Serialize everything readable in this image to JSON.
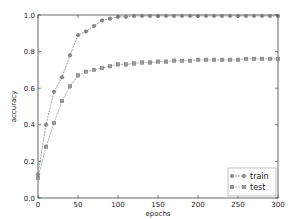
{
  "chart_data": {
    "type": "line",
    "title": "",
    "xlabel": "epochs",
    "ylabel": "accuracy",
    "xlim": [
      0,
      300
    ],
    "ylim": [
      0.0,
      1.0
    ],
    "xticks": [
      0,
      50,
      100,
      150,
      200,
      250,
      300
    ],
    "xtick_labels": [
      "0",
      "50",
      "100",
      "150",
      "200",
      "250",
      "300"
    ],
    "yticks": [
      0.0,
      0.2,
      0.4,
      0.6,
      0.8,
      1.0
    ],
    "ytick_labels": [
      "0.0",
      "0.2",
      "0.4",
      "0.6",
      "0.8",
      "1.0"
    ],
    "grid": false,
    "legend_position": "bottom-right",
    "x": [
      0,
      10,
      20,
      30,
      40,
      50,
      60,
      70,
      80,
      90,
      100,
      110,
      120,
      130,
      140,
      150,
      160,
      170,
      180,
      190,
      200,
      210,
      220,
      230,
      240,
      250,
      260,
      270,
      280,
      290,
      300
    ],
    "series": [
      {
        "name": "train",
        "marker": "circle",
        "color": "#888888",
        "values": [
          0.13,
          0.4,
          0.58,
          0.66,
          0.78,
          0.89,
          0.91,
          0.94,
          0.97,
          0.98,
          0.99,
          0.99,
          0.995,
          0.995,
          0.995,
          0.995,
          0.995,
          0.995,
          0.995,
          0.995,
          0.995,
          0.995,
          0.995,
          0.995,
          0.995,
          0.995,
          0.995,
          0.995,
          0.995,
          0.995,
          0.995
        ]
      },
      {
        "name": "test",
        "marker": "square",
        "color": "#999999",
        "values": [
          0.11,
          0.28,
          0.41,
          0.53,
          0.61,
          0.67,
          0.69,
          0.7,
          0.71,
          0.72,
          0.73,
          0.73,
          0.735,
          0.74,
          0.74,
          0.745,
          0.745,
          0.75,
          0.75,
          0.75,
          0.755,
          0.755,
          0.755,
          0.755,
          0.755,
          0.755,
          0.76,
          0.76,
          0.76,
          0.76,
          0.76
        ]
      }
    ]
  }
}
